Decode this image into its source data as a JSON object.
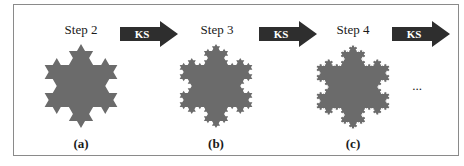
{
  "figure": {
    "steps": [
      {
        "title": "Step 2",
        "panel_label": "(a)",
        "iteration": 2
      },
      {
        "title": "Step 3",
        "panel_label": "(b)",
        "iteration": 3
      },
      {
        "title": "Step 4",
        "panel_label": "(c)",
        "iteration": 4
      }
    ],
    "arrows": [
      {
        "label": "KS"
      },
      {
        "label": "KS"
      },
      {
        "label": "KS"
      }
    ],
    "continuation": "...",
    "colors": {
      "fractal_fill": "#6b6b6b",
      "arrow_fill": "#2e2e2e",
      "border": "#8a8a8a"
    }
  }
}
